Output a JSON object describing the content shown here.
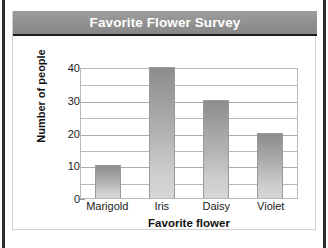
{
  "banner": {
    "title": "Favorite Flower Survey",
    "background_color": "#909090",
    "text_color": "#ffffff"
  },
  "frame": {
    "rail_color": "#2c2c2c",
    "card_border_color": "#cfcfcf",
    "background_color": "#ffffff"
  },
  "chart_data": {
    "type": "bar",
    "title": "Favorite Flower Survey",
    "categories": [
      "Marigold",
      "Iris",
      "Daisy",
      "Violet"
    ],
    "values": [
      10,
      40,
      30,
      20
    ],
    "xlabel": "Favorite flower",
    "ylabel": "Number of people",
    "ylim": [
      0,
      40
    ],
    "ytick_labels": [
      "0",
      "10",
      "20",
      "30",
      "40"
    ],
    "ytick_values": [
      0,
      10,
      20,
      30,
      40
    ],
    "gridline_interval": 5,
    "grid": true,
    "legend": "none",
    "bar_color_top": "#8d8d8d",
    "bar_color_bottom": "#d6d6d6",
    "grid_color": "#b9b9b9"
  }
}
